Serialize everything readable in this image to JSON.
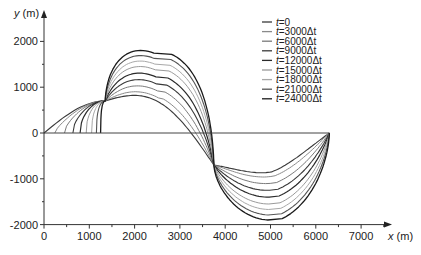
{
  "chart_data": {
    "type": "line",
    "title": "",
    "xlabel": "x (m)",
    "ylabel": "y (m)",
    "xlim": [
      0,
      7800
    ],
    "ylim": [
      -2000,
      2300
    ],
    "x_ticks": [
      0,
      1000,
      2000,
      3000,
      4000,
      5000,
      6000,
      7000
    ],
    "x_tick_labels": [
      "0",
      "1000",
      "2000",
      "3000",
      "4000",
      "5000",
      "6000",
      "7000"
    ],
    "y_ticks": [
      -2000,
      -1000,
      0,
      1000,
      2000
    ],
    "y_tick_labels": [
      "-2000",
      "-1000",
      "0",
      "1000",
      "2000"
    ],
    "grid": false,
    "legend_position": "upper right",
    "domain_x": [
      0,
      6300
    ],
    "baseline": {
      "y": 0,
      "x_start": 0,
      "x_end": 6300
    },
    "pinch_points": [
      {
        "x": 1350,
        "y": 700
      },
      {
        "x": 3750,
        "y": -700
      }
    ],
    "series": [
      {
        "name": "t=0",
        "label_prefix": "t",
        "label_value": "=0",
        "color": "#3a3a3a",
        "width": 1.1,
        "amplitude": 700,
        "bulge": 0.0
      },
      {
        "name": "t=3000Δt",
        "label_prefix": "t",
        "label_value": "=3000Δt",
        "color": "#8a8a8a",
        "width": 1.0,
        "amplitude": 800,
        "bulge": 0.18
      },
      {
        "name": "t=6000Δt",
        "label_prefix": "t",
        "label_value": "=6000Δt",
        "color": "#7a7a7a",
        "width": 1.0,
        "amplitude": 950,
        "bulge": 0.34
      },
      {
        "name": "t=9000Δt",
        "label_prefix": "t",
        "label_value": "=9000Δt",
        "color": "#3a3a3a",
        "width": 1.1,
        "amplitude": 1100,
        "bulge": 0.48
      },
      {
        "name": "t=12000Δt",
        "label_prefix": "t",
        "label_value": "=12000Δt",
        "color": "#2a2a2a",
        "width": 1.2,
        "amplitude": 1250,
        "bulge": 0.6
      },
      {
        "name": "t=15000Δt",
        "label_prefix": "t",
        "label_value": "=15000Δt",
        "color": "#9a9a9a",
        "width": 1.0,
        "amplitude": 1400,
        "bulge": 0.7
      },
      {
        "name": "t=18000Δt",
        "label_prefix": "t",
        "label_value": "=18000Δt",
        "color": "#a8a8a8",
        "width": 1.0,
        "amplitude": 1520,
        "bulge": 0.79
      },
      {
        "name": "t=21000Δt",
        "label_prefix": "t",
        "label_value": "=21000Δt",
        "color": "#555555",
        "width": 1.1,
        "amplitude": 1640,
        "bulge": 0.87
      },
      {
        "name": "t=24000Δt",
        "label_prefix": "t",
        "label_value": "=24000Δt",
        "color": "#1a1a1a",
        "width": 1.3,
        "amplitude": 1750,
        "bulge": 0.94
      }
    ]
  },
  "layout": {
    "plot_origin_px": {
      "x": 44,
      "y": 133
    },
    "px_per_1000_x": 45.3,
    "px_per_1000_y": 45.8,
    "x_axis_end_px": 392,
    "y_axis_top_px": 10,
    "legend_px": {
      "x": 262,
      "y": 22,
      "row_h": 9.6
    }
  }
}
